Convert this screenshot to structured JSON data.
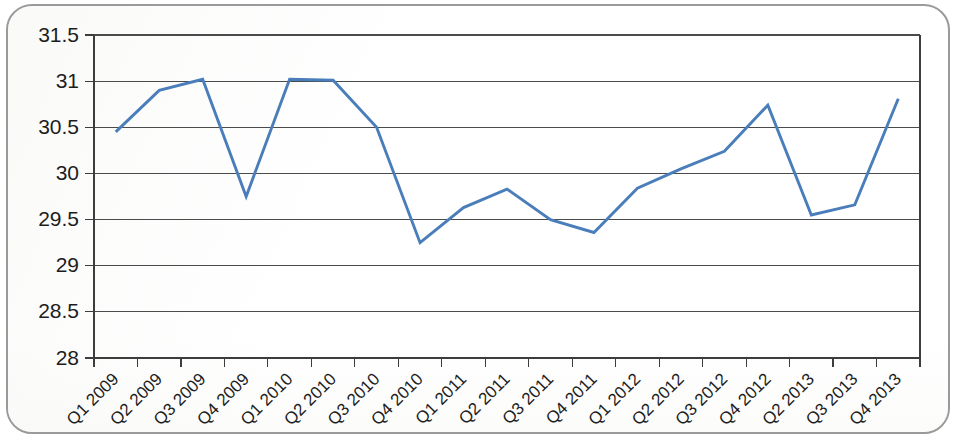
{
  "chart_data": {
    "type": "line",
    "title": "",
    "subtitle": "",
    "xlabel": "",
    "ylabel": "",
    "grid": true,
    "legend": false,
    "legend_position": "none",
    "ylim": [
      28,
      31.5
    ],
    "y_ticks": [
      "28",
      "28.5",
      "29",
      "29.5",
      "30",
      "30.5",
      "31",
      "31.5"
    ],
    "y_tick_values": [
      28,
      28.5,
      29,
      29.5,
      30,
      30.5,
      31,
      31.5
    ],
    "y_tick_interval": 0.5,
    "categories": [
      "Q1 2009",
      "Q2 2009",
      "Q3 2009",
      "Q4 2009",
      "Q1 2010",
      "Q2 2010",
      "Q3 2010",
      "Q4 2010",
      "Q1 2011",
      "Q2 2011",
      "Q3 2011",
      "Q4 2011",
      "Q1 2012",
      "Q2 2012",
      "Q3 2012",
      "Q4 2012",
      "Q2 2013",
      "Q3 2013",
      "Q4 2013"
    ],
    "values": [
      30.45,
      30.9,
      31.02,
      29.75,
      31.02,
      31.01,
      30.5,
      29.25,
      29.63,
      29.83,
      29.5,
      29.36,
      29.84,
      30.05,
      30.24,
      30.74,
      29.55,
      29.66,
      30.81
    ],
    "series": [
      {
        "name": "",
        "color": "#4a7ebb",
        "values": [
          30.45,
          30.9,
          31.02,
          29.75,
          31.02,
          31.01,
          30.5,
          29.25,
          29.63,
          29.83,
          29.5,
          29.36,
          29.84,
          30.05,
          30.24,
          30.74,
          29.55,
          29.66,
          30.81
        ]
      }
    ]
  },
  "style": {
    "line_color": "#4a7ebb",
    "grid_color": "#4b4b4b",
    "axis_color": "#3d3d3d",
    "text_color": "#1d1d1d",
    "card_border_color": "#9a9a9a",
    "background_color": "#ffffff"
  },
  "x_label_rotation": "-45"
}
